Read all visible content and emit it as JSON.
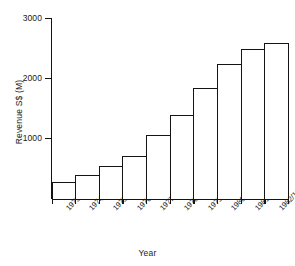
{
  "chart_data": {
    "type": "bar",
    "title": "",
    "xlabel": "Year",
    "ylabel": "Revenue S$ (M)",
    "categories": [
      "1973/1974",
      "1974/1975",
      "1975/1976",
      "1976/1977",
      "1977/1978",
      "1978/1979",
      "1979/1980",
      "1980/1981",
      "1981/1982",
      "1982/1983"
    ],
    "values": [
      285,
      400,
      550,
      720,
      1070,
      1390,
      1840,
      2250,
      2500,
      2600
    ],
    "ylim": [
      0,
      3000
    ],
    "yticks": [
      1000,
      2000,
      3000
    ],
    "ytick_labels": [
      "1000",
      "2000",
      "3000"
    ],
    "grid": false,
    "legend": false,
    "bar_fill_color": "#ffffff",
    "bar_edge_color": "#141414",
    "background_color": "#ffffff",
    "axis_color": "#141414"
  }
}
